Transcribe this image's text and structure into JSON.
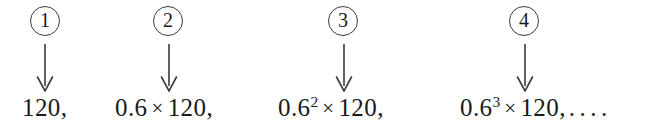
{
  "figure": {
    "type": "sequence-diagram",
    "ink_color": "#1a1a1a",
    "background_color": "#ffffff",
    "markers": [
      {
        "label": "1",
        "glyph": "①"
      },
      {
        "label": "2",
        "glyph": "②"
      },
      {
        "label": "3",
        "glyph": "③"
      },
      {
        "label": "4",
        "glyph": "④"
      }
    ],
    "terms": [
      {
        "coefficient": "",
        "exponent": "",
        "operator": "",
        "base_value": "120",
        "trailing": ",",
        "plain_text": "120,"
      },
      {
        "coefficient": "0.6",
        "exponent": "",
        "operator": "×",
        "base_value": "120",
        "trailing": ",",
        "plain_text": "0.6 × 120,"
      },
      {
        "coefficient": "0.6",
        "exponent": "2",
        "operator": "×",
        "base_value": "120",
        "trailing": ",",
        "plain_text": "0.6² × 120,"
      },
      {
        "coefficient": "0.6",
        "exponent": "3",
        "operator": "×",
        "base_value": "120",
        "trailing": ",",
        "ellipsis": "....",
        "plain_text": "0.6³ × 120, . . . ."
      }
    ]
  }
}
